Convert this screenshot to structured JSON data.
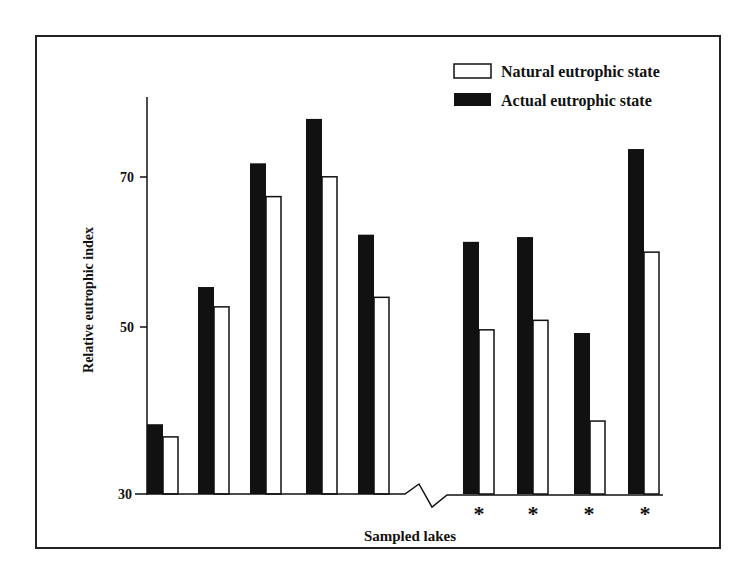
{
  "chart_data": {
    "type": "bar",
    "title": "",
    "xlabel": "Sampled lakes",
    "ylabel": "Relative eutrophic index",
    "ylim": [
      30,
      80
    ],
    "yticks": [
      30,
      50,
      70
    ],
    "grid": false,
    "legend_position": "top-right",
    "axis_break": "x-axis break between lake 5 and lake 6",
    "categories": [
      "1",
      "2",
      "3",
      "4",
      "5",
      "6",
      "7",
      "8",
      "9"
    ],
    "category_markers": [
      "",
      "",
      "",
      "",
      "",
      "*",
      "*",
      "*",
      "*"
    ],
    "series": [
      {
        "name": "Actual eutrophic state",
        "color": "#111111",
        "values": [
          38.8,
          56.1,
          71.7,
          77.3,
          62.7,
          61.8,
          62.4,
          50.3,
          73.5
        ]
      },
      {
        "name": "Natural eutrophic state",
        "color": "#ffffff",
        "values": [
          37.2,
          53.6,
          67.5,
          70.0,
          54.8,
          50.7,
          51.9,
          39.2,
          60.5
        ]
      }
    ]
  },
  "legend": {
    "natural": "Natural eutrophic state",
    "actual": "Actual eutrophic state"
  },
  "axes": {
    "xlabel": "Sampled lakes",
    "ylabel": "Relative eutrophic index",
    "ytick_labels": [
      "30",
      "50",
      "70"
    ],
    "marker": "*"
  }
}
